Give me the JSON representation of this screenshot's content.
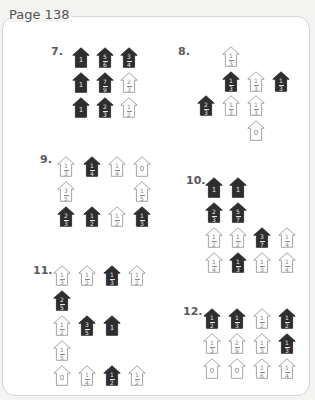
{
  "page": {
    "title": "Page 138"
  },
  "colors": {
    "dark_house": "#2e2e2e",
    "light_house_outline": "#9a9a9a",
    "background": "#ffffff"
  },
  "problems": [
    {
      "label": "7.",
      "label_pos": [
        51,
        45
      ],
      "houses": [
        {
          "x": 72,
          "y": 47,
          "value": "1",
          "shade": "dark"
        },
        {
          "x": 96,
          "y": 47,
          "value": "5/6",
          "shade": "dark"
        },
        {
          "x": 120,
          "y": 47,
          "value": "3/4",
          "shade": "dark"
        },
        {
          "x": 72,
          "y": 72,
          "value": "1",
          "shade": "dark"
        },
        {
          "x": 96,
          "y": 72,
          "value": "7/9",
          "shade": "dark"
        },
        {
          "x": 120,
          "y": 72,
          "value": "2/3",
          "shade": "light"
        },
        {
          "x": 72,
          "y": 97,
          "value": "1",
          "shade": "dark"
        },
        {
          "x": 96,
          "y": 97,
          "value": "2/3",
          "shade": "dark"
        },
        {
          "x": 120,
          "y": 97,
          "value": "1/2",
          "shade": "light"
        }
      ]
    },
    {
      "label": "8.",
      "label_pos": [
        178,
        45
      ],
      "houses": [
        {
          "x": 222,
          "y": 46,
          "value": "1/3",
          "shade": "light"
        },
        {
          "x": 222,
          "y": 71,
          "value": "1/3",
          "shade": "dark"
        },
        {
          "x": 247,
          "y": 71,
          "value": "1/3",
          "shade": "light"
        },
        {
          "x": 272,
          "y": 71,
          "value": "1/3",
          "shade": "dark"
        },
        {
          "x": 197,
          "y": 95,
          "value": "2/3",
          "shade": "dark"
        },
        {
          "x": 222,
          "y": 95,
          "value": "1/3",
          "shade": "light"
        },
        {
          "x": 247,
          "y": 95,
          "value": "1/3",
          "shade": "light"
        },
        {
          "x": 247,
          "y": 120,
          "value": "0",
          "shade": "light"
        }
      ]
    },
    {
      "label": "9.",
      "label_pos": [
        40,
        153
      ],
      "houses": [
        {
          "x": 57,
          "y": 156,
          "value": "1/3",
          "shade": "light"
        },
        {
          "x": 83,
          "y": 156,
          "value": "1/4",
          "shade": "dark"
        },
        {
          "x": 108,
          "y": 156,
          "value": "1/4",
          "shade": "light"
        },
        {
          "x": 133,
          "y": 156,
          "value": "0",
          "shade": "light"
        },
        {
          "x": 57,
          "y": 181,
          "value": "3/5",
          "shade": "light"
        },
        {
          "x": 133,
          "y": 181,
          "value": "1/5",
          "shade": "light"
        },
        {
          "x": 57,
          "y": 206,
          "value": "2/3",
          "shade": "dark"
        },
        {
          "x": 83,
          "y": 206,
          "value": "1/2",
          "shade": "dark"
        },
        {
          "x": 108,
          "y": 206,
          "value": "1/2",
          "shade": "light"
        },
        {
          "x": 133,
          "y": 206,
          "value": "1/3",
          "shade": "dark"
        }
      ]
    },
    {
      "label": "10.",
      "label_pos": [
        186,
        174
      ],
      "houses": [
        {
          "x": 205,
          "y": 177,
          "value": "1",
          "shade": "dark"
        },
        {
          "x": 229,
          "y": 177,
          "value": "1",
          "shade": "dark"
        },
        {
          "x": 205,
          "y": 202,
          "value": "2/3",
          "shade": "dark"
        },
        {
          "x": 229,
          "y": 202,
          "value": "5/7",
          "shade": "dark"
        },
        {
          "x": 205,
          "y": 227,
          "value": "1/2",
          "shade": "light"
        },
        {
          "x": 229,
          "y": 227,
          "value": "1/2",
          "shade": "light"
        },
        {
          "x": 253,
          "y": 227,
          "value": "3/7",
          "shade": "dark"
        },
        {
          "x": 278,
          "y": 227,
          "value": "1/4",
          "shade": "light"
        },
        {
          "x": 205,
          "y": 252,
          "value": "1/4",
          "shade": "light"
        },
        {
          "x": 229,
          "y": 252,
          "value": "1/3",
          "shade": "dark"
        },
        {
          "x": 253,
          "y": 252,
          "value": "1/3",
          "shade": "light"
        },
        {
          "x": 278,
          "y": 252,
          "value": "1/4",
          "shade": "light"
        }
      ]
    },
    {
      "label": "11.",
      "label_pos": [
        33,
        264
      ],
      "houses": [
        {
          "x": 53,
          "y": 265,
          "value": "1/3",
          "shade": "light"
        },
        {
          "x": 78,
          "y": 265,
          "value": "1/2",
          "shade": "light"
        },
        {
          "x": 103,
          "y": 265,
          "value": "1/3",
          "shade": "dark"
        },
        {
          "x": 128,
          "y": 265,
          "value": "1/2",
          "shade": "light"
        },
        {
          "x": 53,
          "y": 290,
          "value": "2/5",
          "shade": "dark"
        },
        {
          "x": 53,
          "y": 315,
          "value": "1/2",
          "shade": "light"
        },
        {
          "x": 78,
          "y": 315,
          "value": "3/5",
          "shade": "dark"
        },
        {
          "x": 103,
          "y": 315,
          "value": "1",
          "shade": "dark"
        },
        {
          "x": 53,
          "y": 340,
          "value": "1/5",
          "shade": "light"
        },
        {
          "x": 53,
          "y": 365,
          "value": "0",
          "shade": "light"
        },
        {
          "x": 78,
          "y": 365,
          "value": "1/4",
          "shade": "light"
        },
        {
          "x": 103,
          "y": 365,
          "value": "1/2",
          "shade": "dark"
        },
        {
          "x": 128,
          "y": 365,
          "value": "1/2",
          "shade": "light"
        }
      ]
    },
    {
      "label": "12.",
      "label_pos": [
        183,
        305
      ],
      "houses": [
        {
          "x": 203,
          "y": 308,
          "value": "1/2",
          "shade": "dark"
        },
        {
          "x": 228,
          "y": 308,
          "value": "1/3",
          "shade": "dark"
        },
        {
          "x": 253,
          "y": 308,
          "value": "1/2",
          "shade": "light"
        },
        {
          "x": 278,
          "y": 308,
          "value": "1/2",
          "shade": "dark"
        },
        {
          "x": 203,
          "y": 333,
          "value": "1/3",
          "shade": "light"
        },
        {
          "x": 228,
          "y": 333,
          "value": "2/9",
          "shade": "light"
        },
        {
          "x": 253,
          "y": 333,
          "value": "1/3",
          "shade": "light"
        },
        {
          "x": 278,
          "y": 333,
          "value": "1/3",
          "shade": "dark"
        },
        {
          "x": 203,
          "y": 358,
          "value": "0",
          "shade": "light"
        },
        {
          "x": 228,
          "y": 358,
          "value": "0",
          "shade": "light"
        },
        {
          "x": 253,
          "y": 358,
          "value": "1/6",
          "shade": "light"
        },
        {
          "x": 278,
          "y": 358,
          "value": "1/4",
          "shade": "light"
        }
      ]
    }
  ]
}
